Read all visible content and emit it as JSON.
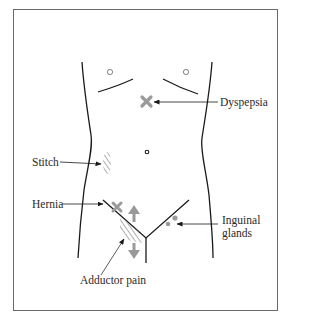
{
  "figure": {
    "title": "",
    "colors": {
      "outline": "#1a1a1a",
      "marker_gray": "#9a9a9a",
      "frame": "#6a6a6a",
      "text": "#2a2a2a"
    }
  },
  "labels": {
    "dyspepsia": "Dyspepsia",
    "stitch": "Stitch",
    "hernia": "Hernia",
    "inguinal_line1": "Inguinal",
    "inguinal_line2": "glands",
    "adductor": "Adductor pain"
  },
  "markers": [
    {
      "id": "dyspepsia",
      "symbol": "x-mark",
      "x": 147,
      "y": 101
    },
    {
      "id": "stitch",
      "symbol": "hatched-region",
      "x": 107,
      "y": 162
    },
    {
      "id": "hernia",
      "symbol": "x-mark",
      "x": 117,
      "y": 207
    },
    {
      "id": "adductor",
      "symbol": "hatched-region-with-arrows",
      "x": 128,
      "y": 228
    },
    {
      "id": "inguinal-glands",
      "symbol": "dots",
      "x": 172,
      "y": 222
    }
  ]
}
